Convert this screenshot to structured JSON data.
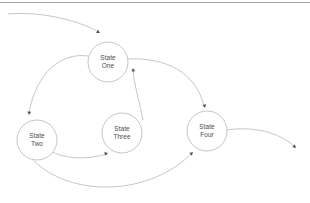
{
  "diagram": {
    "background_color": "#ffffff",
    "node_stroke_color": "#b6b6bc",
    "node_fill_color": "#ffffff",
    "edge_color": "#b6b6bc",
    "arrowhead_color": "#54545a",
    "label_color": "#4a4a50",
    "top_rule_color": "#a9a9af",
    "node_radius": 20,
    "nodes": [
      {
        "id": "state-one",
        "line1": "State",
        "line2": "One",
        "cx": 108,
        "cy": 62
      },
      {
        "id": "state-two",
        "line1": "State",
        "line2": "Two",
        "cx": 37,
        "cy": 140
      },
      {
        "id": "state-three",
        "line1": "State",
        "line2": "Three",
        "cx": 122,
        "cy": 133
      },
      {
        "id": "state-four",
        "line1": "State",
        "line2": "Four",
        "cx": 207,
        "cy": 131
      }
    ],
    "edges": [
      {
        "id": "edge-entry-to-state-one",
        "from": "off-canvas-left",
        "to": "state-one",
        "path": "M 8 14 C 40 11 78 20 99 32",
        "arrow_x": 100,
        "arrow_y": 33,
        "arrow_angle": 30
      },
      {
        "id": "edge-state-one-to-state-two",
        "from": "state-one",
        "to": "state-two",
        "path": "M 88 56 C 62 52 36 72 29 113",
        "arrow_x": 29,
        "arrow_y": 115,
        "arrow_angle": 95
      },
      {
        "id": "edge-state-three-to-state-one",
        "from": "state-three",
        "to": "state-one",
        "path": "M 143 120 C 139 100 134 84 133 70",
        "arrow_x": 133,
        "arrow_y": 68,
        "arrow_angle": -96
      },
      {
        "id": "edge-state-one-to-state-four",
        "from": "state-one",
        "to": "state-four",
        "path": "M 128 59 C 165 57 196 72 204 106",
        "arrow_x": 205,
        "arrow_y": 108,
        "arrow_angle": 78
      },
      {
        "id": "edge-state-two-to-state-three",
        "from": "state-two",
        "to": "state-three",
        "path": "M 52 152 C 72 161 92 158 107 154",
        "arrow_x": 108,
        "arrow_y": 153,
        "arrow_angle": -16
      },
      {
        "id": "edge-state-two-to-state-four",
        "from": "state-two",
        "to": "state-four",
        "path": "M 34 161 C 72 198 150 196 192 153",
        "arrow_x": 193,
        "arrow_y": 152,
        "arrow_angle": -44
      },
      {
        "id": "edge-state-four-to-exit",
        "from": "state-four",
        "to": "off-canvas-right",
        "path": "M 227 130 C 252 126 280 132 295 147",
        "arrow_x": 296,
        "arrow_y": 148,
        "arrow_angle": 44
      }
    ],
    "top_rule": {
      "x1": 0,
      "y1": 2.5,
      "x2": 310,
      "y2": 2.5
    }
  }
}
